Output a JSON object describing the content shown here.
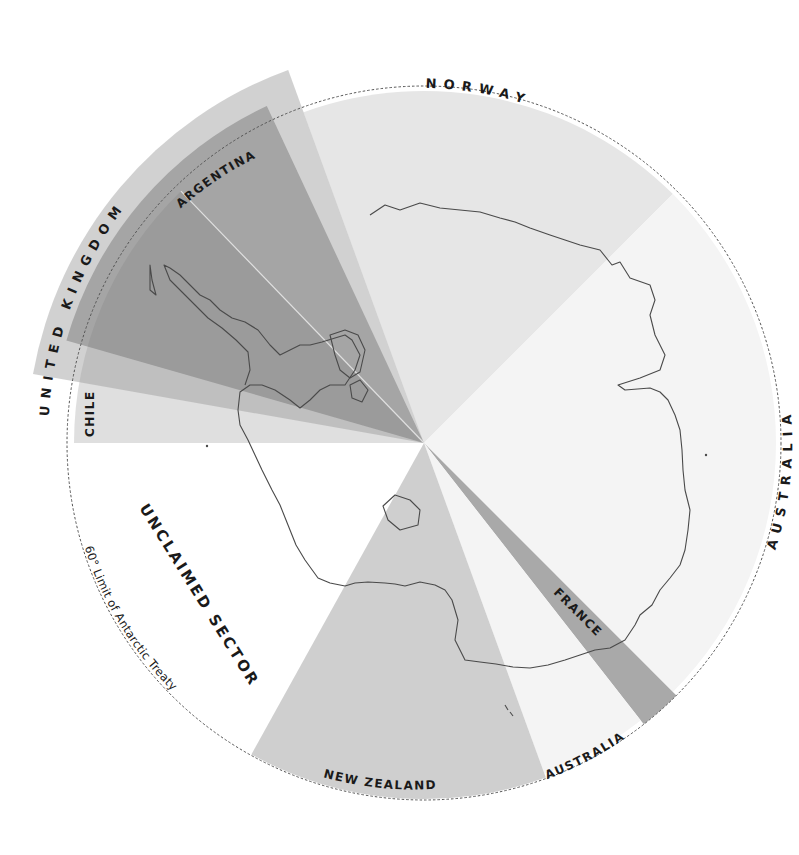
{
  "map": {
    "title": "Antarctic Territorial Claims",
    "center": [
      424,
      443
    ],
    "treaty_circle": {
      "radius": 357,
      "label": "60° Limit of Antarctic Treaty",
      "style": "dashed"
    },
    "sectors": [
      {
        "id": "norway",
        "label": "NORWAY",
        "from_bearing": -20,
        "to_bearing": 45,
        "radius": 352,
        "color": "#e6e6e6"
      },
      {
        "id": "australia-east",
        "label": "AUSTRALIA",
        "from_bearing": 45,
        "to_bearing": 135,
        "radius": 352,
        "color": "#f4f4f4"
      },
      {
        "id": "france",
        "label": "FRANCE",
        "from_bearing": 135,
        "to_bearing": 142,
        "radius": 357,
        "color": "#a9a9a9"
      },
      {
        "id": "australia-west",
        "label": "AUSTRALIA",
        "from_bearing": 142,
        "to_bearing": 160,
        "radius": 352,
        "color": "#f4f4f4"
      },
      {
        "id": "new-zealand",
        "label": "NEW ZEALAND",
        "from_bearing": 160,
        "to_bearing": 209,
        "radius": 356,
        "color": "#cfcfcf"
      },
      {
        "id": "unclaimed",
        "label": "UNCLAIMED SECTOR",
        "from_bearing": 209,
        "to_bearing": 270,
        "radius": 352,
        "color": "#ffffff"
      },
      {
        "id": "chile",
        "label": "CHILE",
        "from_bearing": 270,
        "to_bearing": 316,
        "radius": 350,
        "color": "#bdbdbd"
      },
      {
        "id": "united-kingdom",
        "label": "UNITED KINGDOM",
        "from_bearing": 280,
        "to_bearing": 340,
        "radius": 397,
        "color": "#bcbcbc"
      },
      {
        "id": "argentina",
        "label": "ARGENTINA",
        "from_bearing": 286,
        "to_bearing": 335,
        "radius": 372,
        "color": "#8c8c8c"
      }
    ],
    "labels": {
      "norway": "NORWAY",
      "australia_east": "AUSTRALIA",
      "australia_west": "AUSTRALIA",
      "france": "FRANCE",
      "new_zealand": "NEW ZEALAND",
      "chile": "CHILE",
      "united_kingdom": "UNITED KINGDOM",
      "argentina": "ARGENTINA",
      "unclaimed": "UNCLAIMED SECTOR",
      "treaty_limit": "60° Limit of Antarctic Treaty"
    },
    "colors": {
      "coastline": "#4a4a4a",
      "treaty_circle": "#555555",
      "text": "#1a1a1a",
      "background": "#ffffff"
    }
  }
}
